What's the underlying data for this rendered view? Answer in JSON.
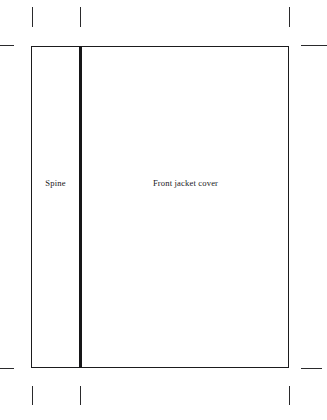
{
  "diagram": {
    "background_color": "#ffffff",
    "line_color": "#1b1b1d",
    "text_color": "#1a1a1c",
    "panels": [
      {
        "name": "spine",
        "label": "Spine"
      },
      {
        "name": "front-jacket-cover",
        "label": "Front jacket cover"
      }
    ],
    "crop_marks": {
      "top": [
        {
          "name": "crop-mark-top-left",
          "x": 32,
          "y": 7,
          "length": 20
        },
        {
          "name": "crop-mark-top-spine",
          "x": 80,
          "y": 7,
          "length": 20
        },
        {
          "name": "crop-mark-top-right",
          "x": 289,
          "y": 7,
          "length": 20
        }
      ],
      "bottom": [
        {
          "name": "crop-mark-bottom-left",
          "x": 32,
          "y": 386,
          "length": 19
        },
        {
          "name": "crop-mark-bottom-spine",
          "x": 80,
          "y": 386,
          "length": 19
        },
        {
          "name": "crop-mark-bottom-right",
          "x": 289,
          "y": 386,
          "length": 19
        }
      ],
      "side": [
        {
          "name": "crop-mark-left-top",
          "x": 0,
          "y": 45,
          "length": 14
        },
        {
          "name": "crop-mark-right-top",
          "x": 301,
          "y": 45,
          "length": 26
        },
        {
          "name": "crop-mark-left-bottom",
          "x": 0,
          "y": 368,
          "length": 14
        },
        {
          "name": "crop-mark-right-bottom",
          "x": 301,
          "y": 368,
          "length": 21
        }
      ]
    }
  }
}
